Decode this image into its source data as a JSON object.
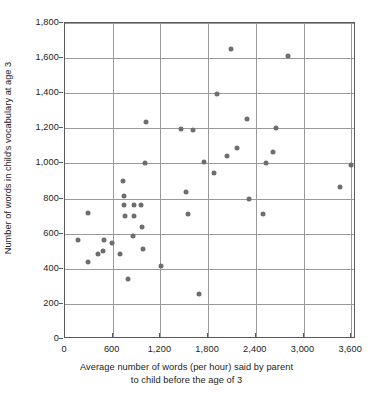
{
  "chart_data": {
    "type": "scatter",
    "title": "",
    "xlabel": "Average number of words (per hour) said by parent to child before the age of 3",
    "xlabel_line1": "Average number of words (per hour) said by parent",
    "xlabel_line2": "to child before the age of 3",
    "ylabel": "Number of words in child's vocabulary at age 3",
    "xlim": [
      0,
      3660
    ],
    "ylim": [
      0,
      1800
    ],
    "xticks": [
      0,
      600,
      1200,
      1800,
      2400,
      3000,
      3600
    ],
    "xticklabels": [
      "0",
      "600",
      "1,200",
      "1,800",
      "2,400",
      "3,000",
      "3,600"
    ],
    "yticks": [
      0,
      200,
      400,
      600,
      800,
      1000,
      1200,
      1400,
      1600,
      1800
    ],
    "yticklabels": [
      "0",
      "200",
      "400",
      "600",
      "800",
      "1,000",
      "1,200",
      "1,400",
      "1,600",
      "1,800"
    ],
    "grid": "both",
    "legend": "none",
    "marker_color": "#6e6e6e",
    "axis_color": "#5a5a5a",
    "grid_color": "#9a9a9a",
    "points": [
      {
        "x": 160,
        "y": 565
      },
      {
        "x": 290,
        "y": 720
      },
      {
        "x": 285,
        "y": 440
      },
      {
        "x": 420,
        "y": 485
      },
      {
        "x": 480,
        "y": 500
      },
      {
        "x": 490,
        "y": 565
      },
      {
        "x": 590,
        "y": 545
      },
      {
        "x": 690,
        "y": 485
      },
      {
        "x": 730,
        "y": 900
      },
      {
        "x": 740,
        "y": 815
      },
      {
        "x": 745,
        "y": 765
      },
      {
        "x": 750,
        "y": 700
      },
      {
        "x": 790,
        "y": 340
      },
      {
        "x": 855,
        "y": 585
      },
      {
        "x": 865,
        "y": 765
      },
      {
        "x": 870,
        "y": 700
      },
      {
        "x": 960,
        "y": 765
      },
      {
        "x": 965,
        "y": 640
      },
      {
        "x": 975,
        "y": 512
      },
      {
        "x": 1010,
        "y": 1000
      },
      {
        "x": 1015,
        "y": 1235
      },
      {
        "x": 1210,
        "y": 415
      },
      {
        "x": 1455,
        "y": 1195
      },
      {
        "x": 1520,
        "y": 840
      },
      {
        "x": 1545,
        "y": 710
      },
      {
        "x": 1605,
        "y": 1190
      },
      {
        "x": 1680,
        "y": 258
      },
      {
        "x": 1750,
        "y": 1010
      },
      {
        "x": 1870,
        "y": 945
      },
      {
        "x": 1905,
        "y": 1395
      },
      {
        "x": 2040,
        "y": 1040
      },
      {
        "x": 2085,
        "y": 1655
      },
      {
        "x": 2160,
        "y": 1090
      },
      {
        "x": 2290,
        "y": 1255
      },
      {
        "x": 2310,
        "y": 795
      },
      {
        "x": 2490,
        "y": 715
      },
      {
        "x": 2530,
        "y": 1000
      },
      {
        "x": 2620,
        "y": 1065
      },
      {
        "x": 2650,
        "y": 1205
      },
      {
        "x": 2800,
        "y": 1610
      },
      {
        "x": 3460,
        "y": 865
      },
      {
        "x": 3600,
        "y": 990
      }
    ]
  }
}
